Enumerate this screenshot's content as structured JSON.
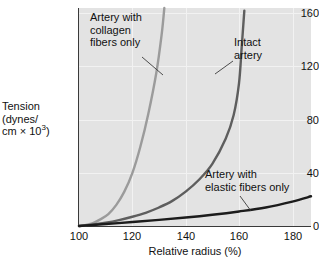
{
  "chart_data": {
    "type": "line",
    "title": "",
    "xlabel": "Relative radius (%)",
    "ylabel": "Tension (dynes/cm × 10³)",
    "ylabel_line1": "Tension",
    "ylabel_line2": "(dynes/",
    "ylabel_line3_pre": "cm × 10",
    "ylabel_line3_sup": "3",
    "ylabel_line3_post": ")",
    "xlim": [
      100,
      187
    ],
    "ylim": [
      0,
      165
    ],
    "xticks": [
      "100",
      "120",
      "140",
      "160",
      "180"
    ],
    "xtick_values": [
      100,
      120,
      140,
      160,
      180
    ],
    "yticks": [
      "0",
      "40",
      "80",
      "120",
      "160"
    ],
    "ytick_values": [
      0,
      40,
      80,
      120,
      160
    ],
    "grid": true,
    "legend_position": "inline-annotations",
    "plot_background": "#e3e3e3",
    "series": [
      {
        "name": "Artery with collagen fibers only",
        "color": "#9b9b9b",
        "x": [
          100,
          102,
          105,
          108,
          111,
          114,
          117,
          120,
          123,
          126,
          129,
          131,
          132
        ],
        "values": [
          0,
          0.5,
          2,
          5,
          9,
          16,
          26,
          40,
          60,
          85,
          116,
          145,
          165
        ]
      },
      {
        "name": "Intact artery",
        "color": "#5e5e5e",
        "x": [
          100,
          105,
          110,
          115,
          120,
          125,
          130,
          135,
          140,
          145,
          150,
          155,
          158,
          160,
          161,
          162
        ],
        "values": [
          0,
          1,
          2.5,
          4.5,
          7,
          10,
          14,
          19,
          26,
          35,
          47,
          66,
          84,
          108,
          135,
          163
        ]
      },
      {
        "name": "Artery with elastic fibers only",
        "color": "#1c1c1c",
        "x": [
          100,
          110,
          120,
          130,
          140,
          150,
          160,
          170,
          180,
          187
        ],
        "values": [
          0,
          1.5,
          3,
          4.6,
          6.4,
          8.5,
          11,
          14,
          18.5,
          22.5
        ]
      }
    ],
    "annotations": [
      {
        "id": "collagen",
        "lines": [
          "Artery with",
          "collagen",
          "fibers only"
        ],
        "leader_from": [
          142,
          57
        ],
        "leader_to": [
          163,
          75
        ]
      },
      {
        "id": "intact",
        "lines": [
          "Intact",
          "artery"
        ],
        "leader_from": [
          233,
          61
        ],
        "leader_to": [
          215,
          74
        ]
      },
      {
        "id": "elastic",
        "lines": [
          "Artery with",
          "elastic fibers only"
        ],
        "leader_from": [
          240,
          196
        ],
        "leader_to": [
          251,
          211
        ]
      }
    ]
  }
}
